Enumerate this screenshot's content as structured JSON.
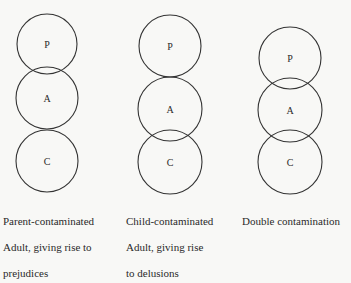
{
  "diagrams": [
    {
      "id": "parent-contaminated",
      "circles": [
        {
          "label": "P",
          "cx": 47,
          "cy": 44,
          "r": 30
        },
        {
          "label": "A",
          "cx": 47,
          "cy": 98,
          "r": 31
        },
        {
          "label": "C",
          "cx": 47,
          "cy": 161,
          "r": 31
        }
      ],
      "caption_lines": [
        "Parent-contaminated",
        "Adult, giving rise to",
        "prejudices"
      ]
    },
    {
      "id": "child-contaminated",
      "circles": [
        {
          "label": "P",
          "cx": 170,
          "cy": 46,
          "r": 31
        },
        {
          "label": "A",
          "cx": 170,
          "cy": 109,
          "r": 32
        },
        {
          "label": "C",
          "cx": 170,
          "cy": 162,
          "r": 32
        }
      ],
      "caption_lines": [
        "Child-contaminated",
        "Adult, giving rise",
        "to delusions"
      ]
    },
    {
      "id": "double-contamination",
      "circles": [
        {
          "label": "P",
          "cx": 290,
          "cy": 58,
          "r": 31
        },
        {
          "label": "A",
          "cx": 290,
          "cy": 110,
          "r": 32
        },
        {
          "label": "C",
          "cx": 290,
          "cy": 162,
          "r": 32
        }
      ],
      "caption_lines": [
        "Double contamination"
      ]
    }
  ]
}
